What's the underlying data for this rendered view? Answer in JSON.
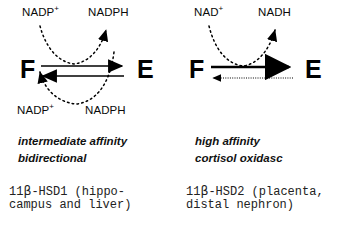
{
  "diagram": {
    "panels": [
      {
        "id": "left",
        "cofactor_top_left": "NADP",
        "cofactor_top_left_charge": "+",
        "cofactor_top_right": "NADPH",
        "cofactor_bottom_left": "NADP",
        "cofactor_bottom_left_charge": "+",
        "cofactor_bottom_right": "NADPH",
        "substrate": "F",
        "product": "E",
        "arrow_forward": "solid-right-arrow",
        "arrow_reverse": "solid-left-arrow",
        "curve_top": "dotted-arc-down-up",
        "curve_bottom": "dotted-arc-up-down",
        "caption_italic_line1": "intermediate affinity",
        "caption_italic_line2": "bidirectional",
        "caption_mono_line1_prefix": "11",
        "caption_mono_line1_beta": "β",
        "caption_mono_line1_suffix": "-HSD1 (hippo-",
        "caption_mono_line2": "campus and liver)"
      },
      {
        "id": "right",
        "cofactor_top_left": "NAD",
        "cofactor_top_left_charge": "+",
        "cofactor_top_right": "NADH",
        "substrate": "F",
        "product": "E",
        "arrow_forward": "bold-solid-right-arrow",
        "arrow_reverse": "thin-dotted-left-arrow",
        "curve_top": "dotted-arc-down-up",
        "caption_italic_line1": "high affinity",
        "caption_italic_line2": "cortisol oxidasc",
        "caption_mono_line1_prefix": "11",
        "caption_mono_line1_beta": "β",
        "caption_mono_line1_suffix": "-HSD2 (placenta,",
        "caption_mono_line2": "distal nephron)"
      }
    ],
    "colors": {
      "ink": "#000000",
      "background": "#ffffff",
      "caption_gray": "#222222"
    }
  }
}
